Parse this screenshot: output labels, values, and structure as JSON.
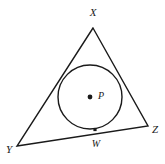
{
  "figure": {
    "background_color": "#ffffff",
    "stroke_color": "#1a1a1a",
    "width": 165,
    "height": 164
  },
  "labels": {
    "x": "X",
    "y": "Y",
    "z": "Z",
    "w": "W",
    "p": "P"
  },
  "geometry": {
    "triangle": {
      "type": "triangle",
      "vertices": [
        {
          "name": "X",
          "x": 93,
          "y": 28
        },
        {
          "name": "Y",
          "x": 17,
          "y": 146
        },
        {
          "name": "Z",
          "x": 148,
          "y": 126
        }
      ],
      "stroke_width": 1.4
    },
    "circle": {
      "type": "circle",
      "center": {
        "name": "P",
        "x": 90,
        "y": 97
      },
      "radius": 32,
      "stroke_width": 1.4
    },
    "points": [
      {
        "name": "P",
        "x": 90,
        "y": 97,
        "marker": "dot",
        "size": 2.4
      },
      {
        "name": "W",
        "x": 95,
        "y": 129.5,
        "marker": "square",
        "size": 3.2
      }
    ],
    "label_positions": {
      "X": {
        "x": 93,
        "y": 13,
        "anchor": "middle"
      },
      "Y": {
        "x": 9,
        "y": 150,
        "anchor": "middle"
      },
      "Z": {
        "x": 155,
        "y": 130,
        "anchor": "middle"
      },
      "W": {
        "x": 96,
        "y": 145,
        "anchor": "middle"
      },
      "P": {
        "x": 98,
        "y": 97,
        "anchor": "middle"
      }
    }
  }
}
